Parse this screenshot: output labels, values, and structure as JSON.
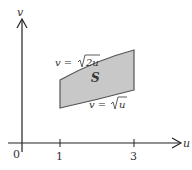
{
  "diagram": {
    "axes": {
      "x_label": "u",
      "y_label": "v",
      "origin_label": "0",
      "x_ticks": [
        {
          "value": 1,
          "label": "1"
        },
        {
          "value": 3,
          "label": "3"
        }
      ]
    },
    "region": {
      "label": "S",
      "upper_curve_label": "v = √2u",
      "upper_curve_prefix": "v = ",
      "upper_curve_radicand": "2u",
      "lower_curve_label": "v = √u",
      "lower_curve_prefix": "v = ",
      "lower_curve_radicand": "u",
      "u_range": [
        1,
        3
      ],
      "fill_color": "#c8c8c8",
      "stroke_color": "#555555"
    },
    "colors": {
      "axis": "#222222",
      "text": "#333333",
      "background": "#ffffff"
    }
  }
}
